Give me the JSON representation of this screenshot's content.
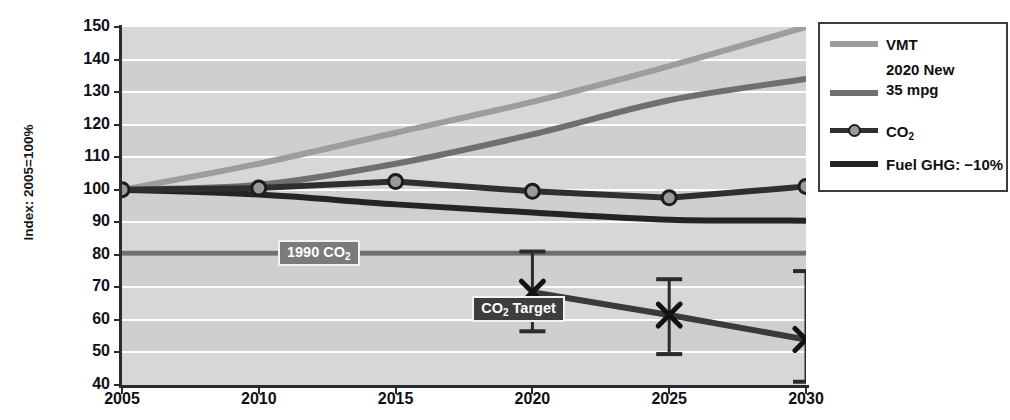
{
  "chart_data": {
    "type": "line",
    "title": "",
    "xlabel": "",
    "ylabel": "Index: 2005=100%",
    "x": [
      2005,
      2010,
      2015,
      2020,
      2025,
      2030
    ],
    "xlim": [
      2005,
      2030
    ],
    "ylim": [
      40,
      150
    ],
    "ytick_step": 10,
    "yticks": [
      150,
      140,
      130,
      120,
      110,
      100,
      90,
      80,
      70,
      60,
      50,
      40
    ],
    "xticks": [
      "2005",
      "2010",
      "2015",
      "2020",
      "2025",
      "2030"
    ],
    "grid": "horizontal-white",
    "legend_position": "right",
    "series": [
      {
        "name": "VMT",
        "color": "#9d9d9d",
        "values": [
          100,
          108,
          117.5,
          127,
          138,
          150
        ]
      },
      {
        "name": "2020 New 35 mpg",
        "color": "#6f6f6f",
        "values": [
          100,
          101.5,
          108,
          117,
          127.5,
          134
        ]
      },
      {
        "name": "CO2",
        "color": "#2f2f2f",
        "marker": "circle",
        "marker_fill": "#9a9a9a",
        "values": [
          100,
          100.5,
          102.5,
          99.5,
          97.5,
          101
        ]
      },
      {
        "name": "Fuel GHG: -10%",
        "color": "#242424",
        "values": [
          100,
          98.5,
          95.5,
          93,
          90.8,
          90.5
        ]
      },
      {
        "name": "CO2 Target",
        "color": "#3a3a3a",
        "marker": "x",
        "x": [
          2020,
          2025,
          2030
        ],
        "values": [
          68.5,
          61.5,
          54
        ],
        "error_high": [
          81,
          72.5,
          75
        ],
        "error_low": [
          56.5,
          49.5,
          41
        ]
      }
    ],
    "reference_lines": [
      {
        "name": "1990 CO2",
        "value": 80.5,
        "color": "#6f6f6f"
      }
    ],
    "annotations": [
      {
        "name": "1990-co2-label",
        "text": "1990 CO",
        "sub": "2",
        "x": 2010.7,
        "y": 80.5,
        "style": "gray"
      },
      {
        "name": "co2-target-label",
        "text": "CO",
        "sub": "2",
        "text2": " Target",
        "x": 2017.8,
        "y": 63.5,
        "style": "dark"
      }
    ]
  },
  "legend": {
    "items": [
      {
        "label": "VMT",
        "color": "#9d9d9d",
        "marker": "none"
      },
      {
        "label_line1": "2020 New",
        "label_line2": "35 mpg",
        "color": "#6f6f6f",
        "marker": "none"
      },
      {
        "label": "CO",
        "sub": "2",
        "color": "#2f2f2f",
        "marker": "circle"
      },
      {
        "label": "Fuel GHG: −10%",
        "color": "#242424",
        "marker": "none"
      }
    ]
  },
  "axis": {
    "y_title": "Index: 2005=100%",
    "y_labels": [
      "150",
      "140",
      "130",
      "120",
      "110",
      "100",
      "90",
      "80",
      "70",
      "60",
      "50",
      "40"
    ],
    "x_labels": [
      "2005",
      "2010",
      "2015",
      "2020",
      "2025",
      "2030"
    ]
  },
  "colors": {
    "plot_background": "#d7d7d7",
    "band": "#cfcfcf",
    "gridline": "#fdfdfd",
    "axis": "#2b2b2b",
    "vmt": "#9d9d9d",
    "mpg35": "#6f6f6f",
    "co2": "#2f2f2f",
    "fuel_ghg": "#242424",
    "target": "#3a3a3a"
  }
}
